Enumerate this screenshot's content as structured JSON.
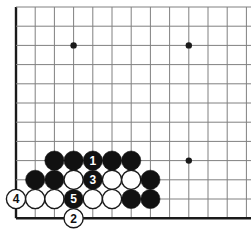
{
  "figure": {
    "kind": "go-board-diagram",
    "board_size": 19,
    "visible_region": "lower-left corner",
    "background_color": "#ffffff",
    "line_color": "#808080",
    "edge_line_color": "#1a1a1a",
    "black_stone_color": "#111111",
    "white_stone_color": "#ffffff",
    "white_stone_outline_color": "#1a1a1a",
    "label_on_black_color": "#ffffff",
    "label_on_white_color": "#111111"
  },
  "geometry": {
    "origin_x": 16,
    "origin_y": 7,
    "spacing": 19.2,
    "columns": 13,
    "rows": 12,
    "stone_radius": 9.6
  },
  "star_points": [
    {
      "name": "star-point-1",
      "col": 3,
      "row": 2
    },
    {
      "name": "star-point-2",
      "col": 9,
      "row": 2
    },
    {
      "name": "star-point-3",
      "col": 9,
      "row": 8
    }
  ],
  "stones": [
    {
      "id": "b-r8c2",
      "color": "black",
      "col": 2,
      "row": 8,
      "label": ""
    },
    {
      "id": "b-r8c3",
      "color": "black",
      "col": 3,
      "row": 8,
      "label": ""
    },
    {
      "id": "b-r8c4",
      "color": "black",
      "col": 4,
      "row": 8,
      "label": "1"
    },
    {
      "id": "b-r8c5",
      "color": "black",
      "col": 5,
      "row": 8,
      "label": ""
    },
    {
      "id": "b-r8c6",
      "color": "black",
      "col": 6,
      "row": 8,
      "label": ""
    },
    {
      "id": "b-r9c1",
      "color": "black",
      "col": 1,
      "row": 9,
      "label": ""
    },
    {
      "id": "b-r9c2",
      "color": "black",
      "col": 2,
      "row": 9,
      "label": ""
    },
    {
      "id": "w-r9c3",
      "color": "white",
      "col": 3,
      "row": 9,
      "label": ""
    },
    {
      "id": "b-r9c4",
      "color": "black",
      "col": 4,
      "row": 9,
      "label": "3"
    },
    {
      "id": "w-r9c5",
      "color": "white",
      "col": 5,
      "row": 9,
      "label": ""
    },
    {
      "id": "w-r9c6",
      "color": "white",
      "col": 6,
      "row": 9,
      "label": ""
    },
    {
      "id": "b-r9c7",
      "color": "black",
      "col": 7,
      "row": 9,
      "label": ""
    },
    {
      "id": "w-r10c0",
      "color": "white",
      "col": 0,
      "row": 10,
      "label": "4"
    },
    {
      "id": "w-r10c1",
      "color": "white",
      "col": 1,
      "row": 10,
      "label": ""
    },
    {
      "id": "w-r10c2",
      "color": "white",
      "col": 2,
      "row": 10,
      "label": ""
    },
    {
      "id": "b-r10c3",
      "color": "black",
      "col": 3,
      "row": 10,
      "label": "5"
    },
    {
      "id": "w-r10c4",
      "color": "white",
      "col": 4,
      "row": 10,
      "label": ""
    },
    {
      "id": "w-r10c5",
      "color": "white",
      "col": 5,
      "row": 10,
      "label": ""
    },
    {
      "id": "b-r10c6",
      "color": "black",
      "col": 6,
      "row": 10,
      "label": ""
    },
    {
      "id": "b-r10c7",
      "color": "black",
      "col": 7,
      "row": 10,
      "label": ""
    },
    {
      "id": "w-r11c3",
      "color": "white",
      "col": 3,
      "row": 11,
      "label": "2"
    }
  ],
  "move_sequence": [
    {
      "number": "1",
      "color": "black"
    },
    {
      "number": "2",
      "color": "white"
    },
    {
      "number": "3",
      "color": "black"
    },
    {
      "number": "4",
      "color": "white"
    },
    {
      "number": "5",
      "color": "black"
    }
  ]
}
